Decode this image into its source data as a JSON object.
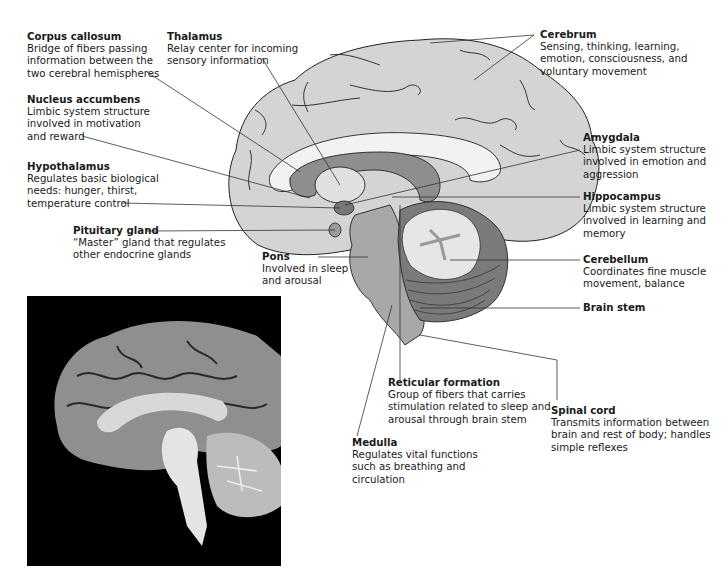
{
  "diagram": {
    "photo_caption": "",
    "structures": [
      {
        "key": "corpus_callosum",
        "title": "Corpus callosum",
        "lines": [
          "Bridge of fibers passing",
          "information between the",
          "two cerebral hemispheres"
        ]
      },
      {
        "key": "thalamus",
        "title": "Thalamus",
        "lines": [
          "Relay center for incoming",
          "sensory information"
        ]
      },
      {
        "key": "cerebrum",
        "title": "Cerebrum",
        "lines": [
          "Sensing, thinking, learning,",
          "emotion, consciousness, and",
          "voluntary movement"
        ]
      },
      {
        "key": "nucleus_accumbens",
        "title": "Nucleus accumbens",
        "lines": [
          "Limbic system structure",
          "involved in motivation",
          "and reward"
        ]
      },
      {
        "key": "hypothalamus",
        "title": "Hypothalamus",
        "lines": [
          "Regulates basic biological",
          "needs: hunger, thirst,",
          "temperature control"
        ]
      },
      {
        "key": "pituitary_gland",
        "title": "Pituitary gland",
        "lines": [
          "“Master” gland that regulates",
          "other endocrine glands"
        ]
      },
      {
        "key": "amygdala",
        "title": "Amygdala",
        "lines": [
          "Limbic system structure",
          "involved in emotion and",
          "aggression"
        ]
      },
      {
        "key": "hippocampus",
        "title": "Hippocampus",
        "lines": [
          "Limbic system structure",
          "involved in learning and",
          "memory"
        ]
      },
      {
        "key": "pons",
        "title": "Pons",
        "lines": [
          "Involved in sleep",
          "and arousal"
        ]
      },
      {
        "key": "cerebellum",
        "title": "Cerebellum",
        "lines": [
          "Coordinates fine muscle",
          "movement, balance"
        ]
      },
      {
        "key": "brain_stem",
        "title": "Brain stem",
        "lines": []
      },
      {
        "key": "reticular_formation",
        "title": "Reticular formation",
        "lines": [
          "Group of fibers that carries",
          "stimulation related to sleep and",
          "arousal through brain stem"
        ]
      },
      {
        "key": "spinal_cord",
        "title": "Spinal cord",
        "lines": [
          "Transmits information between",
          "brain and rest of body; handles",
          "simple reflexes"
        ]
      },
      {
        "key": "medulla",
        "title": "Medulla",
        "lines": [
          "Regulates vital functions",
          "such as breathing and",
          "circulation"
        ]
      }
    ],
    "colors": {
      "cerebrum_fill": "#d4d4d4",
      "corpus_callosum_fill": "#f2f2f2",
      "limbic_fill": "#8e8e8e",
      "brainstem_fill": "#a8a8a8",
      "cerebellum_fill": "#7a7a7a",
      "arbor_fill": "#e6e6e6",
      "leader_line": "#333333",
      "photo_bg": "#000000"
    }
  }
}
